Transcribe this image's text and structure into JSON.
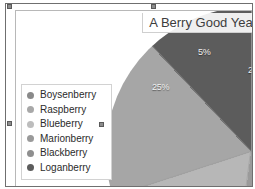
{
  "chart_data": {
    "type": "pie",
    "title": "A Berry Good Year",
    "categories": [
      "Boysenberry",
      "Raspberry",
      "Blueberry",
      "Marionberry",
      "Blackberry",
      "Loganberry"
    ],
    "values": [
      25,
      5,
      22,
      18,
      18,
      12
    ],
    "visible_labels": [
      "25%",
      "5%",
      "2"
    ],
    "colors": [
      "#8a8a8a",
      "#666666",
      "#9b9b9b",
      "#b7b7b7",
      "#a6a6a6",
      "#5c5c5c"
    ],
    "legend_position": "left",
    "grid": false,
    "xlabel": "",
    "ylabel": ""
  },
  "chart": {
    "title": "A Berry Good Year",
    "labels": {
      "slice_25": "25%",
      "slice_5": "5%",
      "slice_2_clipped": "2"
    },
    "legend": {
      "items": [
        {
          "label": "Boysenberry",
          "color": "#8a8a8a"
        },
        {
          "label": "Raspberry",
          "color": "#a8a8a8"
        },
        {
          "label": "Blueberry",
          "color": "#bdbdbd"
        },
        {
          "label": "Marionberry",
          "color": "#9a9a9a"
        },
        {
          "label": "Blackberry",
          "color": "#8f8f8f"
        },
        {
          "label": "Loganberry",
          "color": "#5c5c5c"
        }
      ]
    }
  },
  "selection": {
    "handles": [
      "top-left",
      "top-center",
      "middle-left",
      "legend-middle-right"
    ]
  }
}
